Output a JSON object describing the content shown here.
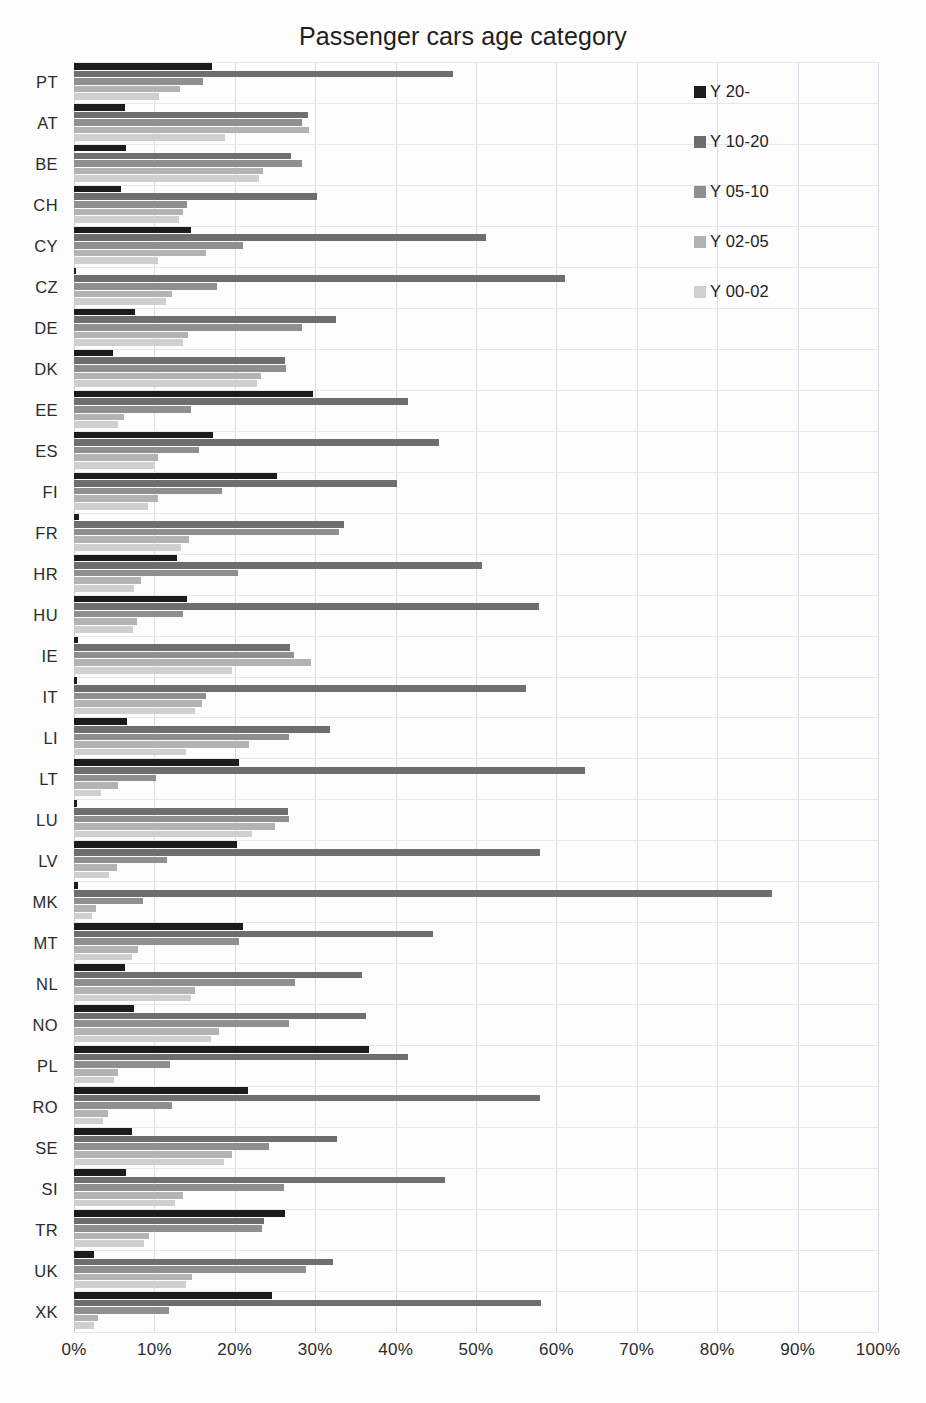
{
  "chart_data": {
    "type": "bar",
    "orientation": "horizontal",
    "title": "Passenger cars age category",
    "xlabel": "",
    "ylabel": "",
    "xlim": [
      0,
      100
    ],
    "x_tick_labels": [
      "0%",
      "10%",
      "20%",
      "30%",
      "40%",
      "50%",
      "60%",
      "70%",
      "80%",
      "90%",
      "100%"
    ],
    "x_ticks": [
      0,
      10,
      20,
      30,
      40,
      50,
      60,
      70,
      80,
      90,
      100
    ],
    "grid": true,
    "legend_position": "top-right",
    "categories": [
      "PT",
      "AT",
      "BE",
      "CH",
      "CY",
      "CZ",
      "DE",
      "DK",
      "EE",
      "ES",
      "FI",
      "FR",
      "HR",
      "HU",
      "IE",
      "IT",
      "LI",
      "LT",
      "LU",
      "LV",
      "MK",
      "MT",
      "NL",
      "NO",
      "PL",
      "RO",
      "SE",
      "SI",
      "TR",
      "UK",
      "XK"
    ],
    "series": [
      {
        "name": "Y 20-",
        "color": "#1c1c1c",
        "values": [
          17.2,
          6.3,
          6.5,
          5.8,
          14.6,
          0.3,
          7.6,
          4.9,
          29.7,
          17.3,
          25.2,
          0.6,
          12.8,
          14.0,
          0.5,
          0.4,
          6.6,
          20.5,
          0.4,
          20.3,
          0.5,
          21.0,
          6.3,
          7.5,
          36.7,
          21.6,
          7.2,
          6.5,
          26.3,
          2.5,
          24.6
        ]
      },
      {
        "name": "Y 10-20",
        "color": "#6e6e6e",
        "values": [
          47.2,
          29.1,
          27.0,
          30.2,
          51.3,
          61.1,
          32.6,
          26.2,
          41.5,
          45.4,
          40.2,
          33.6,
          50.8,
          57.8,
          26.9,
          56.2,
          31.9,
          63.5,
          26.6,
          58.0,
          86.8,
          44.7,
          35.8,
          36.3,
          41.5,
          57.9,
          32.7,
          46.2,
          23.6,
          32.2,
          58.1
        ]
      },
      {
        "name": "Y 05-10",
        "color": "#8f8f8f",
        "values": [
          16.0,
          28.3,
          28.3,
          14.0,
          21.0,
          17.8,
          28.4,
          26.4,
          14.6,
          15.5,
          18.4,
          33.0,
          20.4,
          13.5,
          27.4,
          16.4,
          26.8,
          10.2,
          26.8,
          11.6,
          8.6,
          20.5,
          27.5,
          26.7,
          12.0,
          12.2,
          24.2,
          26.1,
          23.4,
          28.8,
          11.8
        ]
      },
      {
        "name": "Y 02-05",
        "color": "#b3b3b3",
        "values": [
          13.2,
          29.2,
          23.5,
          13.5,
          16.4,
          12.2,
          14.2,
          23.3,
          6.2,
          10.5,
          10.4,
          14.3,
          8.3,
          7.8,
          29.5,
          15.9,
          21.8,
          5.5,
          25.0,
          5.3,
          2.7,
          8.0,
          15.1,
          18.0,
          5.5,
          4.2,
          19.6,
          13.5,
          9.3,
          14.7,
          3.0
        ]
      },
      {
        "name": "Y 00-02",
        "color": "#cfcfcf",
        "values": [
          10.6,
          18.8,
          23.0,
          13.0,
          10.5,
          11.4,
          13.6,
          22.7,
          5.5,
          9.9,
          9.2,
          13.3,
          7.5,
          7.4,
          19.7,
          15.0,
          13.9,
          3.4,
          22.2,
          4.4,
          2.2,
          7.2,
          14.6,
          17.0,
          5.0,
          3.6,
          18.7,
          12.6,
          8.7,
          13.9,
          2.5
        ]
      }
    ]
  },
  "legend": {
    "items": [
      {
        "label": "Y 20-",
        "color": "#1c1c1c"
      },
      {
        "label": "Y 10-20",
        "color": "#6e6e6e"
      },
      {
        "label": "Y 05-10",
        "color": "#8f8f8f"
      },
      {
        "label": "Y 02-05",
        "color": "#b3b3b3"
      },
      {
        "label": "Y 00-02",
        "color": "#cfcfcf"
      }
    ]
  }
}
